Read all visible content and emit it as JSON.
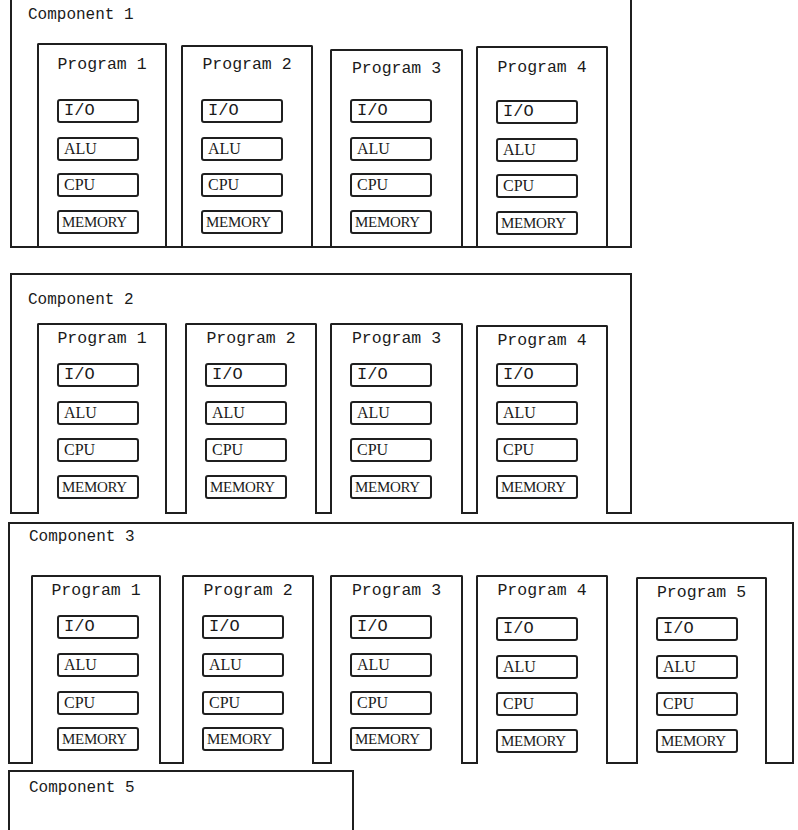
{
  "components": [
    {
      "title": "Component 1",
      "programs": [
        {
          "title": "Program 1",
          "units": [
            "I/O",
            "ALU",
            "CPU",
            "MEMORY"
          ]
        },
        {
          "title": "Program 2",
          "units": [
            "I/O",
            "ALU",
            "CPU",
            "MEMORY"
          ]
        },
        {
          "title": "Program 3",
          "units": [
            "I/O",
            "ALU",
            "CPU",
            "MEMORY"
          ]
        },
        {
          "title": "Program 4",
          "units": [
            "I/O",
            "ALU",
            "CPU",
            "MEMORY"
          ]
        }
      ]
    },
    {
      "title": "Component 2",
      "programs": [
        {
          "title": "Program 1",
          "units": [
            "I/O",
            "ALU",
            "CPU",
            "MEMORY"
          ]
        },
        {
          "title": "Program 2",
          "units": [
            "I/O",
            "ALU",
            "CPU",
            "MEMORY"
          ]
        },
        {
          "title": "Program 3",
          "units": [
            "I/O",
            "ALU",
            "CPU",
            "MEMORY"
          ]
        },
        {
          "title": "Program 4",
          "units": [
            "I/O",
            "ALU",
            "CPU",
            "MEMORY"
          ]
        }
      ]
    },
    {
      "title": "Component 3",
      "programs": [
        {
          "title": "Program 1",
          "units": [
            "I/O",
            "ALU",
            "CPU",
            "MEMORY"
          ]
        },
        {
          "title": "Program 2",
          "units": [
            "I/O",
            "ALU",
            "CPU",
            "MEMORY"
          ]
        },
        {
          "title": "Program 3",
          "units": [
            "I/O",
            "ALU",
            "CPU",
            "MEMORY"
          ]
        },
        {
          "title": "Program 4",
          "units": [
            "I/O",
            "ALU",
            "CPU",
            "MEMORY"
          ]
        },
        {
          "title": "Program 5",
          "units": [
            "I/O",
            "ALU",
            "CPU",
            "MEMORY"
          ]
        }
      ]
    },
    {
      "title": "Component 5",
      "programs": []
    }
  ]
}
